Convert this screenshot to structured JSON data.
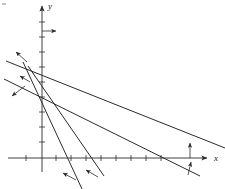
{
  "figure": {
    "background_color": "#ffffff",
    "stroke_color": "#2b2b2b",
    "width": 225,
    "height": 189
  },
  "axes": {
    "x_axis": {
      "label": "x",
      "label_x": 214,
      "label_y": 161,
      "y_pixel": 158,
      "start_x": 8,
      "end_x": 207,
      "arrow": "right",
      "tick_positions": [
        26,
        56,
        71,
        86,
        101,
        116,
        131,
        146,
        161
      ],
      "tick_half_length": 3
    },
    "y_axis": {
      "label": "y",
      "label_x": 48,
      "label_y": 9,
      "x_pixel": 42,
      "start_y": 172,
      "end_y": 6,
      "arrow": "up",
      "tick_positions": [
        22,
        37,
        52,
        67,
        82,
        97,
        112,
        127,
        142
      ],
      "tick_half_length": 3
    },
    "origin": {
      "x": 42,
      "y": 158
    }
  },
  "lines": [
    {
      "name": "line-shallow",
      "x1": 6,
      "y1": 61,
      "x2": 225,
      "y2": 148,
      "description": "gently descending boundary line crossing y-axis high and x-axis far right"
    },
    {
      "name": "line-medium",
      "x1": 4,
      "y1": 79,
      "x2": 200,
      "y2": 176,
      "description": "moderately descending boundary line"
    },
    {
      "name": "line-steep-a",
      "x1": 23,
      "y1": 62,
      "x2": 82,
      "y2": 189,
      "description": "steeply descending boundary line, leftmost x-intercept"
    },
    {
      "name": "line-steep-b",
      "x1": 28,
      "y1": 66,
      "x2": 104,
      "y2": 176,
      "description": "steeply descending boundary line, second x-intercept"
    }
  ],
  "direction_arrows": [
    {
      "name": "arrow-y-axis-right",
      "x1": 42,
      "y1": 31,
      "x2": 56,
      "y2": 31,
      "note": "indicates x greater-than-or-equal-to zero"
    },
    {
      "name": "arrow-x-axis-up",
      "x1": 190,
      "y1": 158,
      "x2": 190,
      "y2": 143,
      "note": "indicates y greater-than-or-equal-to zero"
    },
    {
      "name": "arrow-shallow-upleft",
      "x1": 27,
      "y1": 62,
      "x2": 16,
      "y2": 52,
      "note": "feasible side of shallow line"
    },
    {
      "name": "arrow-medium-upleft",
      "x1": 30,
      "y1": 82,
      "x2": 20,
      "y2": 76,
      "note": "feasible side of medium line"
    },
    {
      "name": "arrow-steep-downleft",
      "x1": 25,
      "y1": 86,
      "x2": 12,
      "y2": 96,
      "note": "feasible side of steep line, pointing down-left"
    },
    {
      "name": "arrow-steep-a-upleft",
      "x1": 76,
      "y1": 180,
      "x2": 63,
      "y2": 173,
      "note": "feasible side of steep line a"
    },
    {
      "name": "arrow-steep-b-upleft",
      "x1": 98,
      "y1": 177,
      "x2": 86,
      "y2": 170,
      "note": "feasible side of steep line b"
    },
    {
      "name": "arrow-medium-upright",
      "x1": 188,
      "y1": 175,
      "x2": 191,
      "y2": 162,
      "note": "feasible side of medium line near x-axis"
    }
  ],
  "corner_mark": {
    "name": "top-left-tick",
    "x": 3,
    "y": 3
  }
}
